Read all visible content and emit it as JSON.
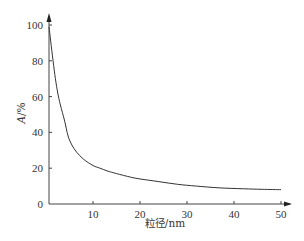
{
  "chart_data": {
    "type": "line",
    "title": "",
    "xlabel": "粒径/nm",
    "ylabel": "A/%",
    "ylabel_italic_part": "A",
    "ylabel_suffix": "/%",
    "xlim": [
      0,
      50
    ],
    "ylim": [
      0,
      100
    ],
    "x_ticks": [
      10,
      20,
      30,
      40,
      50
    ],
    "y_ticks": [
      0,
      20,
      40,
      60,
      80,
      100
    ],
    "grid": false,
    "legend": null,
    "series": [
      {
        "name": "A",
        "color": "#333333",
        "x": [
          0.6,
          1,
          1.5,
          2,
          2.5,
          3,
          3.5,
          4,
          4.7,
          5.5,
          6.5,
          8,
          10,
          11.5,
          13,
          15,
          18,
          20,
          24,
          28,
          32,
          37,
          42,
          46,
          50
        ],
        "y": [
          99,
          91,
          80,
          70,
          62,
          56,
          51,
          46,
          38,
          33,
          29,
          25,
          21.5,
          20,
          18.5,
          17,
          15,
          14,
          12.5,
          11,
          10,
          9,
          8.5,
          8.2,
          8
        ]
      }
    ]
  },
  "axes": {
    "x_tick_labels": [
      "10",
      "20",
      "30",
      "40",
      "50"
    ],
    "y_tick_labels": [
      "0",
      "20",
      "40",
      "60",
      "80",
      "100"
    ],
    "origin_label": "0",
    "x_title": "粒径/nm",
    "y_title_italic": "A",
    "y_title_suffix": "/%"
  }
}
